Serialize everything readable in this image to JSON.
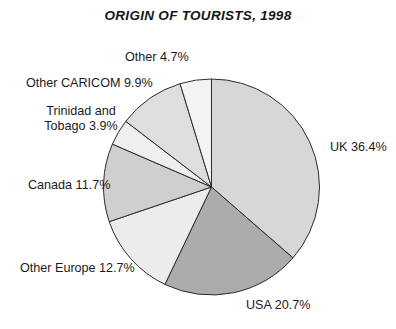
{
  "chart": {
    "title": "ORIGIN OF TOURISTS, 1998"
  },
  "labels": {
    "uk": "UK 36.4%",
    "usa": "USA 20.7%",
    "other_europe": "Other Europe 12.7%",
    "canada": "Canada 11.7%",
    "trinidad_tobago": "Trinidad and Tobago 3.9%",
    "other_caricom": "Other CARICOM 9.9%",
    "other": "Other 4.7%"
  },
  "chart_data": {
    "type": "pie",
    "title": "ORIGIN OF TOURISTS, 1998",
    "xlabel": "",
    "ylabel": "",
    "unit": "%",
    "start_angle_deg": 0,
    "direction": "clockwise",
    "center": [
      211.5,
      187
    ],
    "radius": 108,
    "legend_position": "outside-labels",
    "grid": false,
    "categories": [
      "UK",
      "USA",
      "Other Europe",
      "Canada",
      "Trinidad and Tobago",
      "Other CARICOM",
      "Other"
    ],
    "values": [
      36.4,
      20.7,
      12.7,
      11.7,
      3.9,
      9.9,
      4.7
    ],
    "slice_labels": [
      "UK 36.4%",
      "USA 20.7%",
      "Other Europe 12.7%",
      "Canada 11.7%",
      "Trinidad and Tobago 3.9%",
      "Other CARICOM 9.9%",
      "Other 4.7%"
    ],
    "colors": [
      "#d7d7d7",
      "#acacac",
      "#ececec",
      "#cfcfcf",
      "#efefef",
      "#dedede",
      "#f3f3f3"
    ],
    "stroke_color": "#2b2b2b"
  }
}
